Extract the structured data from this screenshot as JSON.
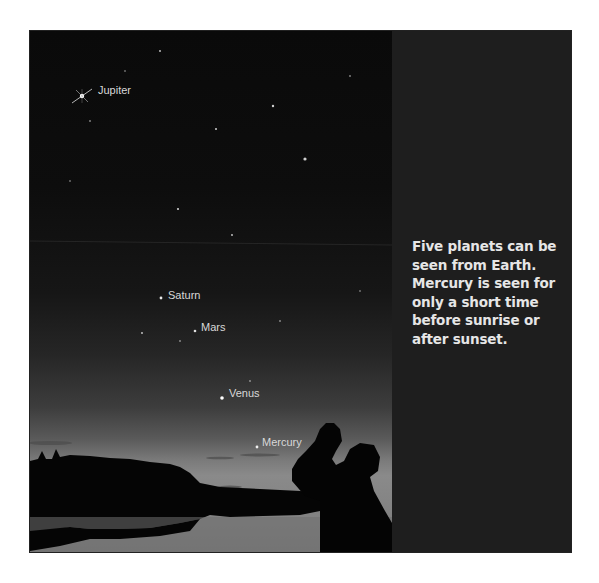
{
  "figure": {
    "planet_labels": [
      {
        "name": "Jupiter"
      },
      {
        "name": "Saturn"
      },
      {
        "name": "Mars"
      },
      {
        "name": "Venus"
      },
      {
        "name": "Mercury"
      }
    ],
    "caption": "Five planets can be seen from Earth. Mercury is seen for only a short time before sunrise or after sunset.",
    "colors": {
      "sky_top": "#0a0a0a",
      "sky_horizon": "#8a8a8a",
      "caption_panel": "#1e1e1e",
      "caption_text": "#e6e6e6",
      "label_text": "#d8d8d8"
    }
  }
}
